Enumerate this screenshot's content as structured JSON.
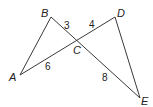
{
  "diagram": {
    "type": "geometry-figure",
    "vertices": [
      {
        "id": "A",
        "label": "A",
        "x": 20,
        "y": 75,
        "label_x": 9,
        "label_y": 81
      },
      {
        "id": "B",
        "label": "B",
        "x": 51,
        "y": 17,
        "label_x": 41,
        "label_y": 17
      },
      {
        "id": "C",
        "label": "C",
        "x": 77,
        "y": 41,
        "label_x": 73,
        "label_y": 54
      },
      {
        "id": "D",
        "label": "D",
        "x": 115,
        "y": 17,
        "label_x": 117,
        "label_y": 17
      },
      {
        "id": "E",
        "label": "E",
        "x": 140,
        "y": 98,
        "label_x": 141,
        "label_y": 105
      }
    ],
    "segments": [
      {
        "from": "A",
        "to": "B"
      },
      {
        "from": "B",
        "to": "E"
      },
      {
        "from": "A",
        "to": "D"
      },
      {
        "from": "D",
        "to": "E"
      }
    ],
    "lengths": [
      {
        "segment": "BC",
        "value": "3",
        "x": 64,
        "y": 29
      },
      {
        "segment": "CD",
        "value": "4",
        "x": 89,
        "y": 28
      },
      {
        "segment": "AC",
        "value": "6",
        "x": 45,
        "y": 70
      },
      {
        "segment": "CE",
        "value": "8",
        "x": 102,
        "y": 81
      }
    ]
  }
}
